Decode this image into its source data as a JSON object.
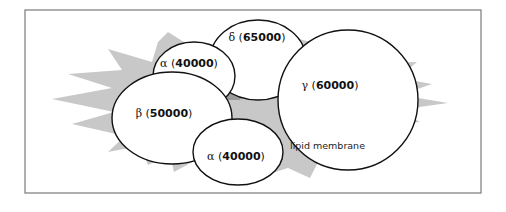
{
  "frame": {
    "border_color": "#7a7a7a",
    "background": "#ffffff"
  },
  "membrane": {
    "label": "lipid membrane",
    "fill": "#c8c8c8"
  },
  "subunits": [
    {
      "id": "delta",
      "greek": "δ",
      "open": " (",
      "mass": "65000",
      "close": ")"
    },
    {
      "id": "alpha-top",
      "greek": "α",
      "open": " (",
      "mass": "40000",
      "close": ")"
    },
    {
      "id": "gamma",
      "greek": "γ",
      "open": " (",
      "mass": "60000",
      "close": ")"
    },
    {
      "id": "beta",
      "greek": "β",
      "open": " (",
      "mass": "50000",
      "close": ")"
    },
    {
      "id": "alpha-bottom",
      "greek": "α",
      "open": " (",
      "mass": "40000",
      "close": ")"
    }
  ],
  "colors": {
    "subunit_fill": "#ffffff",
    "subunit_stroke": "#111111",
    "gap_fill": "#9a9a9a"
  }
}
